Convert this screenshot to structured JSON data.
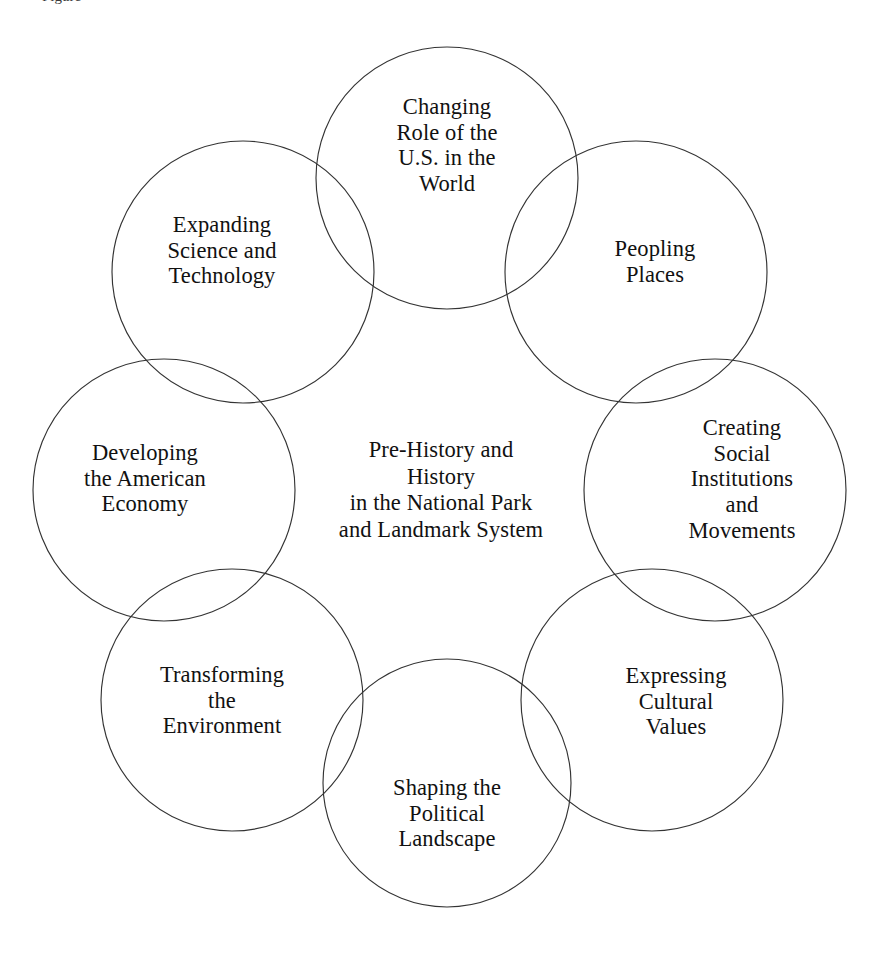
{
  "diagram": {
    "type": "venn-ring",
    "title_remnant": "Figure",
    "background_color": "#ffffff",
    "stroke_color": "#333333",
    "text_color": "#111111",
    "center": {
      "name": "center-theme",
      "text": "Pre-History and\nHistory\nin the National Park\nand Landmark System",
      "x": 441,
      "y": 490
    },
    "ring": {
      "center_x": 441,
      "center_y": 490,
      "ring_radius": 222,
      "circle_radius": 131,
      "count": 8
    },
    "petals": [
      {
        "id": "changing-role-us-world",
        "text": "Changing\nRole of the\nU.S. in the\nWorld",
        "cx": 447,
        "cy": 178,
        "r": 131,
        "label_x": 447,
        "label_y": 145
      },
      {
        "id": "peopling-places",
        "text": "Peopling\nPlaces",
        "cx": 636,
        "cy": 272,
        "r": 131,
        "label_x": 655,
        "label_y": 262
      },
      {
        "id": "creating-social-institutions-movements",
        "text": "Creating\nSocial\nInstitutions\nand\nMovements",
        "cx": 715,
        "cy": 490,
        "r": 131,
        "label_x": 742,
        "label_y": 479
      },
      {
        "id": "expressing-cultural-values",
        "text": "Expressing\nCultural\nValues",
        "cx": 652,
        "cy": 700,
        "r": 131,
        "label_x": 676,
        "label_y": 701
      },
      {
        "id": "shaping-political-landscape",
        "text": "Shaping the\nPolitical\nLandscape",
        "cx": 447,
        "cy": 783,
        "r": 124,
        "label_x": 447,
        "label_y": 813
      },
      {
        "id": "transforming-environment",
        "text": "Transforming\nthe\nEnvironment",
        "cx": 232,
        "cy": 700,
        "r": 131,
        "label_x": 222,
        "label_y": 700
      },
      {
        "id": "developing-american-economy",
        "text": "Developing\nthe American\nEconomy",
        "cx": 164,
        "cy": 490,
        "r": 131,
        "label_x": 145,
        "label_y": 478
      },
      {
        "id": "expanding-science-technology",
        "text": "Expanding\nScience and\nTechnology",
        "cx": 243,
        "cy": 272,
        "r": 131,
        "label_x": 222,
        "label_y": 250
      }
    ]
  }
}
